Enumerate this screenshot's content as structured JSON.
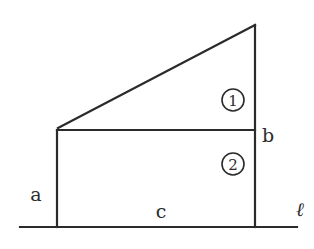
{
  "diagram": {
    "type": "geometry-figure",
    "labels": {
      "a": "a",
      "b": "b",
      "c": "c",
      "line": "ℓ"
    },
    "regions": [
      {
        "id": "region-1",
        "label": "1",
        "shape": "right-triangle"
      },
      {
        "id": "region-2",
        "label": "2",
        "shape": "rectangle"
      }
    ],
    "side_meaning": {
      "a": "height of left vertical side",
      "b": "height of right vertical side",
      "c": "length of bottom side on line l"
    },
    "colors": {
      "stroke": "#2b2b2b",
      "background": "#ffffff"
    }
  }
}
